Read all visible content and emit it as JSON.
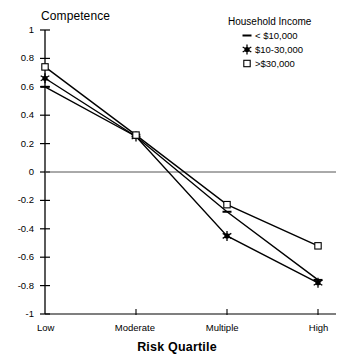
{
  "chart_data": {
    "type": "line",
    "title": "",
    "xlabel": "Risk Quartile",
    "ylabel": "Competence",
    "categories": [
      "Low",
      "Moderate",
      "Multiple",
      "High"
    ],
    "ylim": [
      -1,
      1
    ],
    "yticks": [
      1,
      0.8,
      0.6,
      0.4,
      0.2,
      0,
      -0.2,
      -0.4,
      -0.6,
      -0.8,
      -1
    ],
    "ytick_labels": [
      "1",
      "0.8",
      "0.6",
      "0.4",
      "0.2",
      "0",
      "-0.2",
      "-0.4",
      "-0.6",
      "-0.8",
      "-1"
    ],
    "grid": false,
    "zero_reference_line": true,
    "legend_position": "top-right",
    "legend_title": "Household Income",
    "series": [
      {
        "name": "< $10,000",
        "marker": "dash",
        "values": [
          0.6,
          0.25,
          -0.28,
          -0.76
        ]
      },
      {
        "name": "$10-30,000",
        "marker": "star",
        "values": [
          0.66,
          0.25,
          -0.45,
          -0.78
        ]
      },
      {
        "name": ">$30,000",
        "marker": "open-square",
        "values": [
          0.74,
          0.26,
          -0.23,
          -0.52
        ]
      }
    ]
  },
  "axes": {
    "y_title": "Competence",
    "x_title": "Risk Quartile"
  },
  "legend": {
    "title": "Household Income",
    "items": [
      {
        "label": "< $10,000",
        "marker": "dash-marker"
      },
      {
        "label": "$10-30,000",
        "marker": "star-marker"
      },
      {
        "label": ">$30,000",
        "marker": "open-square-marker"
      }
    ]
  },
  "colors": {
    "line": "#000000",
    "axis": "#000000",
    "zero_line": "#555555",
    "background": "#ffffff"
  }
}
